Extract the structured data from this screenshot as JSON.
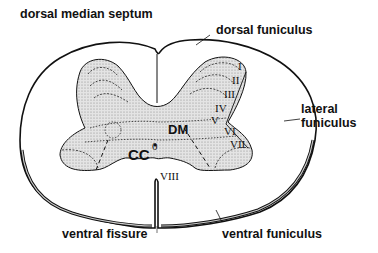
{
  "labels": {
    "dorsal_median_septum": "dorsal median septum",
    "dorsal_funiculus": "dorsal funiculus",
    "lateral_funiculus_line1": "lateral",
    "lateral_funiculus_line2": "funiculus",
    "ventral_fissure": "ventral fissure",
    "ventral_funiculus": "ventral funiculus",
    "dm": "DM",
    "cc": "CC",
    "cc_superscript": "0"
  },
  "laminae": [
    "I",
    "II",
    "III",
    "IV",
    "V",
    "VI",
    "VII",
    "VIII"
  ],
  "colors": {
    "outline": "#111111",
    "gray_matter_fill": "#d9d9d9",
    "background": "#ffffff"
  }
}
